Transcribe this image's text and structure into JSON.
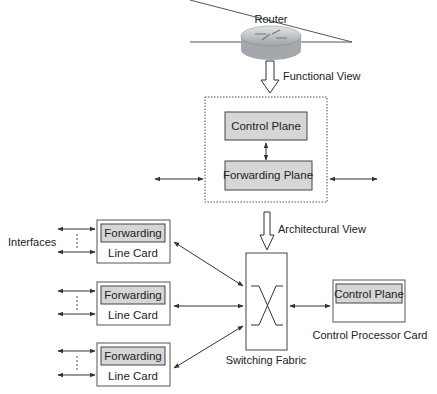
{
  "router": {
    "label": "Router"
  },
  "functional_view": {
    "label": "Functional View",
    "control_plane": "Control Plane",
    "forwarding_plane": "Forwarding Plane"
  },
  "architectural_view": {
    "label": "Architectural View",
    "interfaces_label": "Interfaces",
    "line_cards": [
      {
        "inner": "Forwarding",
        "label": "Line Card"
      },
      {
        "inner": "Forwarding",
        "label": "Line Card"
      },
      {
        "inner": "Forwarding",
        "label": "Line Card"
      }
    ],
    "switching_fabric": "Switching Fabric",
    "control_processor": {
      "inner": "Control Plane",
      "label": "Control Processor Card"
    }
  },
  "colors": {
    "box_fill": "#d6d6d6",
    "line": "#333333",
    "router_body": "#b8bcc0"
  }
}
